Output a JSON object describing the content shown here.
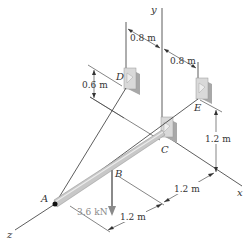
{
  "figure": {
    "type": "3D statics diagram"
  },
  "axes": {
    "x": "x",
    "y": "y",
    "z": "z"
  },
  "points": {
    "A": "A",
    "B": "B",
    "C": "C",
    "D": "D",
    "E": "E"
  },
  "dimensions": {
    "d_top_left": "0.8 m",
    "d_top_right": "0.8 m",
    "d_D_height": "0.6 m",
    "d_E_height": "1.2 m",
    "d_CB": "1.2 m",
    "d_BA": "1.2 m"
  },
  "load": {
    "label": "3.6 kN",
    "color": "#8a8a8a"
  },
  "colors": {
    "line": "#333333",
    "boom": "#bdbdbd",
    "support_face": "#d9d9d9",
    "support_side": "#a8a8a8"
  }
}
